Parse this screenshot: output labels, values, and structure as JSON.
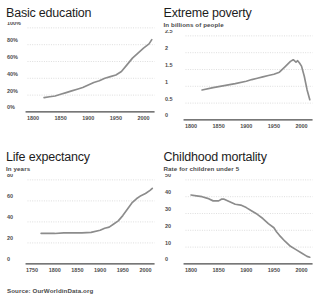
{
  "source": {
    "text": "Source: OurWorldinData.org"
  },
  "chart_data": [
    {
      "id": "basic-education",
      "type": "line",
      "title": "Basic education",
      "subtitle": "",
      "xlabel": "",
      "ylabel": "",
      "xlim": [
        1790,
        2020
      ],
      "ylim": [
        0,
        100
      ],
      "grid": true,
      "legend": "none",
      "xticks": [
        "1800",
        "1850",
        "1900",
        "1950",
        "2000"
      ],
      "xtick_values": [
        1800,
        1850,
        1900,
        1950,
        2000
      ],
      "yticks": [
        "0%",
        "20%",
        "40%",
        "60%",
        "80%",
        "100%"
      ],
      "ytick_values": [
        0,
        20,
        40,
        60,
        80,
        100
      ],
      "series": [
        {
          "name": "Share of world population with basic education",
          "x": [
            1820,
            1830,
            1840,
            1850,
            1860,
            1870,
            1880,
            1890,
            1900,
            1910,
            1920,
            1930,
            1940,
            1950,
            1960,
            1970,
            1980,
            1990,
            2000,
            2010,
            2015
          ],
          "values": [
            17,
            18,
            19,
            21,
            23,
            25,
            27,
            29,
            32,
            35,
            37,
            40,
            42,
            44,
            48,
            56,
            64,
            70,
            76,
            81,
            86
          ]
        }
      ]
    },
    {
      "id": "extreme-poverty",
      "type": "line",
      "title": "Extreme poverty",
      "subtitle": "In billions of people",
      "xlabel": "",
      "ylabel": "",
      "xlim": [
        1790,
        2020
      ],
      "ylim": [
        0,
        2.5
      ],
      "grid": true,
      "legend": "none",
      "xticks": [
        "1800",
        "1850",
        "1900",
        "1950",
        "2000"
      ],
      "xtick_values": [
        1800,
        1850,
        1900,
        1950,
        2000
      ],
      "yticks": [
        "0",
        "0.5",
        "1",
        "1.5",
        "2",
        "2.5"
      ],
      "ytick_values": [
        0,
        0.5,
        1,
        1.5,
        2,
        2.5
      ],
      "series": [
        {
          "name": "People living in extreme poverty",
          "x": [
            1820,
            1840,
            1860,
            1880,
            1900,
            1910,
            1920,
            1930,
            1940,
            1950,
            1960,
            1970,
            1975,
            1980,
            1985,
            1990,
            1993,
            1996,
            2000,
            2005,
            2010,
            2015
          ],
          "values": [
            0.89,
            0.96,
            1.02,
            1.08,
            1.15,
            1.2,
            1.24,
            1.28,
            1.32,
            1.36,
            1.42,
            1.58,
            1.66,
            1.74,
            1.79,
            1.72,
            1.76,
            1.7,
            1.6,
            1.3,
            0.9,
            0.6
          ]
        }
      ]
    },
    {
      "id": "life-expectancy",
      "type": "line",
      "title": "Life expectancy",
      "subtitle": "In years",
      "xlabel": "",
      "ylabel": "",
      "xlim": [
        1740,
        2020
      ],
      "ylim": [
        0,
        80
      ],
      "grid": true,
      "legend": "none",
      "xticks": [
        "1750",
        "1800",
        "1850",
        "1900",
        "1950",
        "2000"
      ],
      "xtick_values": [
        1750,
        1800,
        1850,
        1900,
        1950,
        2000
      ],
      "yticks": [
        "0",
        "20",
        "40",
        "60",
        "80"
      ],
      "ytick_values": [
        0,
        20,
        40,
        60,
        80
      ],
      "series": [
        {
          "name": "World life expectancy at birth",
          "x": [
            1770,
            1800,
            1820,
            1840,
            1860,
            1880,
            1900,
            1910,
            1920,
            1930,
            1940,
            1950,
            1960,
            1970,
            1980,
            1990,
            2000,
            2010,
            2015
          ],
          "values": [
            29,
            29,
            29.5,
            29.5,
            29.5,
            30,
            32,
            34,
            35,
            38,
            41,
            46,
            52,
            58,
            62,
            65,
            67,
            70,
            72
          ]
        }
      ]
    },
    {
      "id": "childhood-mortality",
      "type": "line",
      "title": "Childhood mortality",
      "subtitle": "Rate for children under 5",
      "xlabel": "",
      "ylabel": "",
      "xlim": [
        1790,
        2020
      ],
      "ylim": [
        0,
        50
      ],
      "grid": true,
      "legend": "none",
      "xticks": [
        "1800",
        "1850",
        "1900",
        "1950",
        "2000"
      ],
      "xtick_values": [
        1800,
        1850,
        1900,
        1950,
        2000
      ],
      "yticks": [
        "0",
        "10",
        "20",
        "30",
        "40",
        "50"
      ],
      "ytick_values": [
        0,
        10,
        20,
        30,
        40,
        50
      ],
      "series": [
        {
          "name": "Share of children dying before age five",
          "x": [
            1800,
            1810,
            1820,
            1830,
            1840,
            1850,
            1855,
            1860,
            1870,
            1880,
            1890,
            1900,
            1910,
            1920,
            1930,
            1940,
            1950,
            1955,
            1960,
            1970,
            1980,
            1990,
            2000,
            2010,
            2015
          ],
          "values": [
            41,
            40.5,
            40,
            39,
            37.5,
            37.5,
            38.5,
            38.5,
            37,
            35.5,
            35,
            33.5,
            31.5,
            29.5,
            27,
            24,
            21.5,
            19,
            17,
            13.5,
            10.5,
            8.5,
            6.5,
            4.5,
            4
          ]
        }
      ]
    }
  ]
}
